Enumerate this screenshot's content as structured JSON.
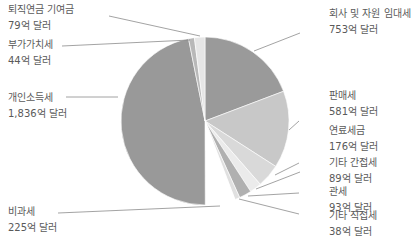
{
  "chart_data": {
    "type": "pie",
    "title": "",
    "unit": "억 달러",
    "slices": [
      {
        "label": "회사 및 자원 임대세",
        "value": 753,
        "display": "753억 달러",
        "color": "#9a9a9a"
      },
      {
        "label": "판매세",
        "value": 581,
        "display": "581억 달러",
        "color": "#c8c8c8"
      },
      {
        "label": "연료세금",
        "value": 176,
        "display": "176억 달러",
        "color": "#d9d9d9"
      },
      {
        "label": "기타 간접세",
        "value": 89,
        "display": "89억 달러",
        "color": "#ebebeb"
      },
      {
        "label": "관세",
        "value": 93,
        "display": "93억 달러",
        "color": "#b0b0b0"
      },
      {
        "label": "기타 직접세",
        "value": 38,
        "display": "38억 달러",
        "color": "#e0e0e0"
      },
      {
        "label": "비과세",
        "value": 225,
        "display": "225억 달러",
        "color": "#ffffff"
      },
      {
        "label": "개인소득세",
        "value": 1836,
        "display": "1,836억 달러",
        "color": "#999999"
      },
      {
        "label": "부가가치세",
        "value": 44,
        "display": "44억 달러",
        "color": "#b8b8b8"
      },
      {
        "label": "퇴직연금 기여금",
        "value": 79,
        "display": "79억 달러",
        "color": "#e6e6e6"
      }
    ],
    "legend": "callout labels",
    "start_angle_deg": 0,
    "direction": "clockwise"
  },
  "labels": [
    {
      "name": "퇴직연금 기여금",
      "value": "79억 달러"
    },
    {
      "name": "부가가치세",
      "value": "44억 달러"
    },
    {
      "name": "개인소득세",
      "value": "1,836억 달러"
    },
    {
      "name": "비과세",
      "value": "225억 달러"
    },
    {
      "name": "회사 및 자원 임대세",
      "value": "753억 달러"
    },
    {
      "name": "판매세",
      "value": "581억 달러"
    },
    {
      "name": "연료세금",
      "value": "176억 달러"
    },
    {
      "name": "기타 간접세",
      "value": "89억 달러"
    },
    {
      "name": "관세",
      "value": "93억 달러"
    },
    {
      "name": "기타 직접세",
      "value": "38억 달러"
    }
  ]
}
